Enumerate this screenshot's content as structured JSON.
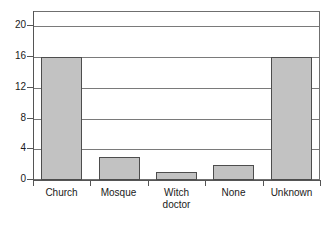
{
  "chart_data": {
    "type": "bar",
    "title": "",
    "xlabel": "",
    "ylabel": "",
    "categories": [
      "Church",
      "Mosque",
      "Witch doctor",
      "None",
      "Unknown"
    ],
    "values": [
      16,
      3,
      1,
      2,
      16
    ],
    "ylim": [
      0,
      22
    ],
    "yticks": [
      0,
      4,
      8,
      12,
      16,
      20
    ],
    "ytick_labels": [
      "0",
      "4",
      "8",
      "12",
      "16",
      "20"
    ],
    "grid": true,
    "legend": false,
    "bar_color": "#c2c2c2",
    "bar_edge_color": "#4d4d4d",
    "axis_color": "#555555",
    "grid_color": "#7a7a7a",
    "background": "#ffffff"
  },
  "axis": {
    "y_tick_labels": [
      "0",
      "4",
      "8",
      "12",
      "16",
      "20"
    ]
  },
  "categories": [
    {
      "label": "Church",
      "value": 16
    },
    {
      "label": "Mosque",
      "value": 3
    },
    {
      "label": "Witch\ndoctor",
      "value": 1
    },
    {
      "label": "None",
      "value": 2
    },
    {
      "label": "Unknown",
      "value": 16
    }
  ]
}
